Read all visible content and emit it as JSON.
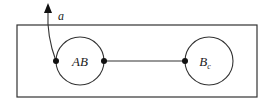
{
  "diagram": {
    "type": "state-machine",
    "container": {
      "x": 17,
      "y": 25,
      "width": 240,
      "height": 72
    },
    "nodes": [
      {
        "id": "AB",
        "label": "AB",
        "cx": 80,
        "cy": 61,
        "r": 24
      },
      {
        "id": "Bc",
        "label": "B",
        "subscript": "c",
        "cx": 209,
        "cy": 61,
        "r": 24
      }
    ],
    "edges": [
      {
        "from": "AB",
        "to": "Bc",
        "type": "line"
      }
    ],
    "external_arrow": {
      "label": "a",
      "from": "AB",
      "direction": "up-out"
    },
    "colors": {
      "stroke": "#333333",
      "dot": "#111111",
      "background": "#ffffff"
    }
  }
}
